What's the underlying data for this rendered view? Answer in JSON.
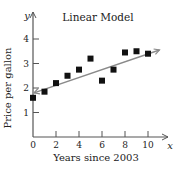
{
  "chart_data": {
    "type": "scatter",
    "title": "Linear Model",
    "xlabel": "Years since 2003",
    "ylabel": "Price per gallon",
    "x_axis_letter": "x",
    "y_axis_letter": "y",
    "xlim": [
      0,
      11
    ],
    "ylim": [
      0,
      4.5
    ],
    "x_ticks": [
      0,
      2,
      4,
      6,
      8,
      10
    ],
    "y_ticks": [
      1,
      2,
      3,
      4
    ],
    "grid": false,
    "series": [
      {
        "name": "Data points",
        "marker": "square",
        "color": "#111111",
        "x": [
          0,
          1,
          2,
          3,
          4,
          5,
          6,
          7,
          8,
          9,
          10
        ],
        "y": [
          1.6,
          1.85,
          2.2,
          2.5,
          2.75,
          3.2,
          2.3,
          2.75,
          3.45,
          3.5,
          3.4
        ]
      },
      {
        "name": "Linear model",
        "type": "line",
        "color": "#8a8a8a",
        "x": [
          0,
          11
        ],
        "y": [
          1.8,
          3.55
        ],
        "arrows": "both"
      }
    ]
  }
}
